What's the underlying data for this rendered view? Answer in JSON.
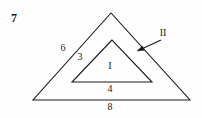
{
  "figure": {
    "problem_number": "7",
    "stroke_color": "#1a1a1a",
    "background_color": "#fefefe",
    "outer_triangle": {
      "name": "outer-triangle",
      "vertices": [
        [
          111,
          13
        ],
        [
          33,
          100
        ],
        [
          190,
          100
        ]
      ],
      "labels": {
        "left_side": "6",
        "base": "8"
      }
    },
    "inner_triangle": {
      "name": "inner-triangle",
      "vertices": [
        [
          112,
          40
        ],
        [
          72,
          82
        ],
        [
          152,
          82
        ]
      ],
      "labels": {
        "left_side": "3",
        "base": "4"
      }
    },
    "region_labels": [
      {
        "text": "I",
        "x": 110,
        "y": 66,
        "note": "inside inner triangle"
      },
      {
        "text": "II",
        "x": 163,
        "y": 33,
        "note": "band between triangles, with leader arrow"
      }
    ],
    "length_labels": [
      {
        "text": "6",
        "x": 63,
        "y": 48
      },
      {
        "text": "3",
        "x": 80,
        "y": 57
      },
      {
        "text": "4",
        "x": 110,
        "y": 89
      },
      {
        "text": "8",
        "x": 110,
        "y": 107
      }
    ],
    "leader_arrow": {
      "name": "region-ii-arrow",
      "from": [
        161,
        40
      ],
      "to": [
        137,
        51
      ]
    }
  }
}
